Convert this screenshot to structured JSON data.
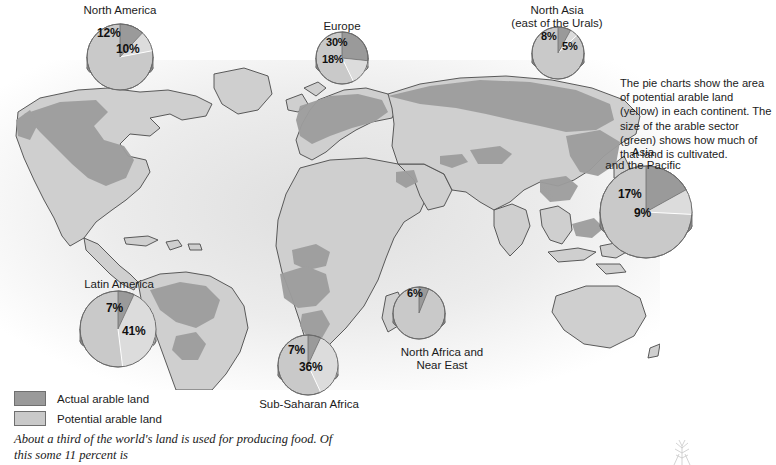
{
  "chart_data": {
    "type": "pie",
    "units": "percent of continental land area",
    "legend": {
      "position": "bottom-left",
      "entries": [
        {
          "label": "Actual arable land",
          "color": "#9a9a9a",
          "key": "actual"
        },
        {
          "label": "Potential arable land",
          "color": "#c9c9c9",
          "key": "potential"
        }
      ]
    },
    "note": "The pie charts show the area of potential arable land (yellow) in each continent. The size of the arable sector (green) shows how much of that land is cultivated.",
    "series": [
      {
        "name": "Actual arable land",
        "values": [
          12,
          30,
          8,
          7,
          7,
          6,
          17
        ]
      },
      {
        "name": "Potential arable land",
        "values": [
          10,
          18,
          5,
          41,
          36,
          0,
          9
        ]
      }
    ],
    "categories": [
      "North America",
      "Europe",
      "North Asia (east of the Urals)",
      "Latin America",
      "Sub-Saharan Africa",
      "North Africa and Near East",
      "Asia and the Pacific"
    ],
    "pies": [
      {
        "id": "north-america",
        "title_lines": [
          "North America"
        ],
        "title_left": 60,
        "title_top": 4,
        "title_width": 120,
        "cx": 120,
        "cy": 57,
        "r": 33,
        "depth": 11,
        "actual": {
          "value": 12,
          "display": "12%",
          "label_left": 97,
          "label_top": 26
        },
        "potential": {
          "value": 10,
          "display": "10%",
          "label_left": 116,
          "label_top": 42
        },
        "actual_start_deg": 0,
        "actual_sweep_deg": 43,
        "potential_start_deg": 43,
        "potential_sweep_deg": 36
      },
      {
        "id": "europe",
        "title_lines": [
          "Europe"
        ],
        "title_left": 300,
        "title_top": 20,
        "title_width": 84,
        "cx": 342,
        "cy": 58,
        "r": 26,
        "depth": 9,
        "actual": {
          "value": 30,
          "display": "30%",
          "label_left": 326,
          "label_top": 36
        },
        "potential": {
          "value": 18,
          "display": "18%",
          "label_left": 322,
          "label_top": 53
        },
        "actual_start_deg": 0,
        "actual_sweep_deg": 96,
        "potential_start_deg": 96,
        "potential_sweep_deg": 58
      },
      {
        "id": "north-asia",
        "title_lines": [
          "North Asia",
          "(east of the Urals)"
        ],
        "title_left": 497,
        "title_top": 4,
        "title_width": 120,
        "cx": 558,
        "cy": 53,
        "r": 26,
        "depth": 9,
        "actual": {
          "value": 8,
          "display": "8%",
          "label_left": 541,
          "label_top": 30
        },
        "potential": {
          "value": 5,
          "display": "5%",
          "label_left": 562,
          "label_top": 40
        },
        "actual_start_deg": 0,
        "actual_sweep_deg": 29,
        "potential_start_deg": 29,
        "potential_sweep_deg": 18
      },
      {
        "id": "asia-pacific",
        "title_lines": [
          "Asia",
          "and the Pacific"
        ],
        "title_left": 578,
        "title_top": 146,
        "title_width": 130,
        "cx": 646,
        "cy": 212,
        "r": 46,
        "depth": 14,
        "actual": {
          "value": 17,
          "display": "17%",
          "label_left": 618,
          "label_top": 187
        },
        "potential": {
          "value": 9,
          "display": "9%",
          "label_left": 634,
          "label_top": 206
        },
        "actual_start_deg": 0,
        "actual_sweep_deg": 61,
        "potential_start_deg": 61,
        "potential_sweep_deg": 32
      },
      {
        "id": "latin-america",
        "title_lines": [
          "Latin America"
        ],
        "title_left": 60,
        "title_top": 278,
        "title_width": 118,
        "cx": 118,
        "cy": 329,
        "r": 38,
        "depth": 12,
        "actual": {
          "value": 7,
          "display": "7%",
          "label_left": 106,
          "label_top": 301
        },
        "potential": {
          "value": 41,
          "display": "41%",
          "label_left": 122,
          "label_top": 324
        },
        "actual_start_deg": 0,
        "actual_sweep_deg": 25,
        "potential_start_deg": 25,
        "potential_sweep_deg": 148
      },
      {
        "id": "sub-saharan-africa",
        "title_lines": [
          "Sub-Saharan Africa"
        ],
        "title_left": 239,
        "title_top": 398,
        "title_width": 140,
        "cx": 308,
        "cy": 365,
        "r": 30,
        "depth": 10,
        "actual": {
          "value": 7,
          "display": "7%",
          "label_left": 288,
          "label_top": 343
        },
        "potential": {
          "value": 36,
          "display": "36%",
          "label_left": 299,
          "label_top": 360
        },
        "actual_start_deg": 0,
        "actual_sweep_deg": 25,
        "potential_start_deg": 25,
        "potential_sweep_deg": 130
      },
      {
        "id": "north-africa-near-east",
        "title_lines": [
          "North Africa and",
          "Near East"
        ],
        "title_left": 382,
        "title_top": 346,
        "title_width": 120,
        "cx": 419,
        "cy": 313,
        "r": 26,
        "depth": 9,
        "actual": {
          "value": 6,
          "display": "6%",
          "label_left": 407,
          "label_top": 287
        },
        "potential": {
          "value": 0,
          "display": "",
          "label_left": 0,
          "label_top": 0
        },
        "actual_start_deg": 0,
        "actual_sweep_deg": 22,
        "potential_start_deg": 22,
        "potential_sweep_deg": 0
      }
    ]
  },
  "caption": {
    "body": "About a third of the world's land is used for producing food. Of this some 11 percent is"
  },
  "colors": {
    "actual": "#9a9a9a",
    "potential": "#c9c9c9",
    "pie_side": "#8e8e8e",
    "pie_outline": "#6b6b6b",
    "land": "#cfcfcf",
    "arable_overlay": "#9d9d9d",
    "coast": "#4a4a4a"
  }
}
